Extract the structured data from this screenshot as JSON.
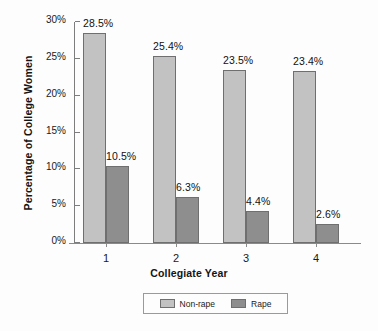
{
  "chart_data": {
    "type": "bar",
    "title": "",
    "xlabel": "Collegiate Year",
    "ylabel": "Percentage of College Women",
    "categories": [
      "1",
      "2",
      "3",
      "4"
    ],
    "series": [
      {
        "name": "Non-rape",
        "color": "#c2c2c2",
        "values": [
          28.5,
          25.4,
          23.5,
          23.4
        ],
        "labels": [
          "28.5%",
          "25.4%",
          "23.5%",
          "23.4%"
        ]
      },
      {
        "name": "Rape",
        "color": "#8e8e8e",
        "values": [
          10.5,
          6.3,
          4.4,
          2.6
        ],
        "labels": [
          "10.5%",
          "6.3%",
          "4.4%",
          "2.6%"
        ]
      }
    ],
    "ylim": [
      0,
      30
    ],
    "ytick_values": [
      0,
      5,
      10,
      15,
      20,
      25,
      30
    ],
    "ytick_labels": [
      "0%",
      "5%",
      "10%",
      "15%",
      "20%",
      "25%",
      "30%"
    ],
    "grid": false,
    "legend_position": "bottom"
  },
  "legend": {
    "items": [
      {
        "label": "Non-rape",
        "swatch": "legend-swatch-non-rape"
      },
      {
        "label": "Rape",
        "swatch": "legend-swatch-rape"
      }
    ]
  }
}
